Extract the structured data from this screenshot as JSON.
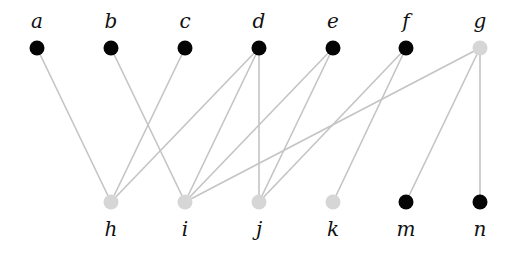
{
  "diagram": {
    "type": "bipartite-graph",
    "colors": {
      "dark_node": "#050505",
      "light_node": "#d6d6d6",
      "edge": "#c4c4c4",
      "label": "#111111"
    },
    "top_nodes": [
      {
        "id": "a",
        "label": "a",
        "x": 37,
        "y": 48,
        "shade": "dark"
      },
      {
        "id": "b",
        "label": "b",
        "x": 111,
        "y": 48,
        "shade": "dark"
      },
      {
        "id": "c",
        "label": "c",
        "x": 185,
        "y": 48,
        "shade": "dark"
      },
      {
        "id": "d",
        "label": "d",
        "x": 259,
        "y": 48,
        "shade": "dark"
      },
      {
        "id": "e",
        "label": "e",
        "x": 333,
        "y": 48,
        "shade": "dark"
      },
      {
        "id": "f",
        "label": "f",
        "x": 406,
        "y": 48,
        "shade": "dark"
      },
      {
        "id": "g",
        "label": "g",
        "x": 480,
        "y": 48,
        "shade": "light"
      }
    ],
    "bottom_nodes": [
      {
        "id": "h",
        "label": "h",
        "x": 111,
        "y": 202,
        "shade": "light"
      },
      {
        "id": "i",
        "label": "i",
        "x": 185,
        "y": 202,
        "shade": "light"
      },
      {
        "id": "j",
        "label": "j",
        "x": 259,
        "y": 202,
        "shade": "light"
      },
      {
        "id": "k",
        "label": "k",
        "x": 333,
        "y": 202,
        "shade": "light"
      },
      {
        "id": "m",
        "label": "m",
        "x": 406,
        "y": 202,
        "shade": "dark"
      },
      {
        "id": "n",
        "label": "n",
        "x": 480,
        "y": 202,
        "shade": "dark"
      }
    ],
    "edges": [
      [
        "a",
        "h"
      ],
      [
        "b",
        "i"
      ],
      [
        "c",
        "h"
      ],
      [
        "d",
        "h"
      ],
      [
        "d",
        "i"
      ],
      [
        "d",
        "j"
      ],
      [
        "e",
        "i"
      ],
      [
        "e",
        "j"
      ],
      [
        "f",
        "j"
      ],
      [
        "f",
        "k"
      ],
      [
        "g",
        "i"
      ],
      [
        "g",
        "m"
      ],
      [
        "g",
        "n"
      ]
    ]
  }
}
